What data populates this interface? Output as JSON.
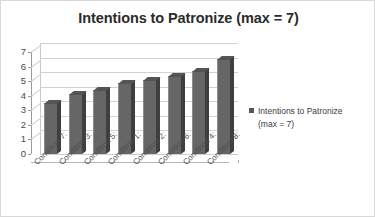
{
  "chart_data": {
    "type": "bar",
    "title": "Intentions to Patronize (max = 7)",
    "xlabel": "",
    "ylabel": "",
    "ylim": [
      0,
      7
    ],
    "yticks": [
      0,
      1,
      2,
      3,
      4,
      5,
      6,
      7
    ],
    "grid": true,
    "legend_position": "right",
    "three_d": true,
    "categories": [
      "Condition 7:",
      "Condition 3:",
      "Condition 5:",
      "Condition 1:",
      "Condition 2:",
      "Condition 6:",
      "Condition 4:",
      "Condition 8:"
    ],
    "series": [
      {
        "name": "Intentions to Patronize (max = 7)",
        "values": [
          3.5,
          4.1,
          4.4,
          4.9,
          5.1,
          5.35,
          5.7,
          6.5
        ],
        "color": "#666666"
      }
    ]
  },
  "legend": {
    "label": "Intentions to Patronize (max = 7)",
    "swatch_color": "#585858"
  },
  "colors": {
    "bar_front": "#666666",
    "bar_side": "#3f3f3f",
    "bar_top": "#545454",
    "gridline": "#d2d2d2",
    "axis": "#9a9a9a",
    "title": "#2b2b2b",
    "frame": "#d8d8d8",
    "background": "#ffffff"
  }
}
